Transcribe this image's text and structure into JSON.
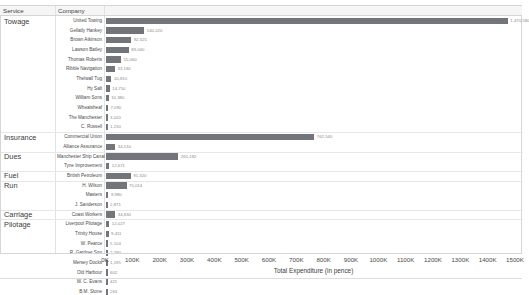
{
  "header": {
    "service_label": "Service",
    "company_label": "Company"
  },
  "axis": {
    "title": "Total Expenditure (in pence)",
    "ticks": [
      "0K",
      "100K",
      "200K",
      "300K",
      "400K",
      "500K",
      "600K",
      "700K",
      "800K",
      "900K",
      "1000K",
      "1100K",
      "1200K",
      "1300K",
      "1400K",
      "1500K"
    ],
    "min": 0,
    "max": 1500000
  },
  "colors": {
    "bar": "#72757a",
    "header_bg": "#f5f5f5",
    "grid": "#e7e7e7",
    "value_text": "#8a8a8a"
  },
  "chart_data": {
    "type": "bar",
    "orientation": "horizontal",
    "title": "",
    "xlabel": "Total Expenditure (in pence)",
    "ylabel": "",
    "xlim": [
      0,
      1500000
    ],
    "grid": false,
    "legend": "none",
    "groups": [
      {
        "service": "Towage",
        "rows": [
          {
            "company": "United Towing",
            "value": 1470000,
            "label": "1,470,580"
          },
          {
            "company": "Gellatly Hankey",
            "value": 140000,
            "label": "140,220"
          },
          {
            "company": "Brown Atkinson",
            "value": 92000,
            "label": "92,325"
          },
          {
            "company": "Lawson Batley",
            "value": 83000,
            "label": "83,040"
          },
          {
            "company": "Thomas Roberts",
            "value": 55000,
            "label": "55,060"
          },
          {
            "company": "Ribble Navigation",
            "value": 33000,
            "label": "33,180"
          },
          {
            "company": "Thelwall Tug",
            "value": 20000,
            "label": "20,810"
          },
          {
            "company": "Hy Salt",
            "value": 14000,
            "label": "14,750"
          },
          {
            "company": "William Sons",
            "value": 10000,
            "label": "10,380"
          },
          {
            "company": "Wheatsheaf",
            "value": 7000,
            "label": "7,090"
          },
          {
            "company": "The Manchester",
            "value": 3000,
            "label": "3,020"
          },
          {
            "company": "C. Russell",
            "value": 1200,
            "label": "1,230"
          }
        ]
      },
      {
        "service": "Insurance",
        "rows": [
          {
            "company": "Commercial Union",
            "value": 762000,
            "label": "762,540"
          },
          {
            "company": "Alliance Assurance",
            "value": 34000,
            "label": "34,510"
          }
        ]
      },
      {
        "service": "Dues",
        "rows": [
          {
            "company": "Manchester Ship Canal",
            "value": 265000,
            "label": "265,182"
          },
          {
            "company": "Tyne Improvement",
            "value": 12000,
            "label": "12,671"
          }
        ]
      },
      {
        "service": "Fuel",
        "rows": [
          {
            "company": "British Petroleum",
            "value": 91000,
            "label": "91,320"
          }
        ]
      },
      {
        "service": "Run",
        "rows": [
          {
            "company": "H. Wilson",
            "value": 75000,
            "label": "75,014"
          },
          {
            "company": "Masters",
            "value": 9000,
            "label": "9,980"
          },
          {
            "company": "J. Sanderson",
            "value": 2800,
            "label": "2,871"
          }
        ]
      },
      {
        "service": "Carriage",
        "rows": [
          {
            "company": "Coast Workers",
            "value": 34000,
            "label": "34,830"
          }
        ]
      },
      {
        "service": "Pilotage",
        "rows": [
          {
            "company": "Liverpool Pilotage",
            "value": 12000,
            "label": "12,027"
          },
          {
            "company": "Trinity House",
            "value": 9400,
            "label": "9,411"
          },
          {
            "company": "W. Pearce",
            "value": 5100,
            "label": "5,104"
          },
          {
            "company": "R. Gardner Son",
            "value": 2200,
            "label": "2,290"
          },
          {
            "company": "Mersey Docks",
            "value": 1100,
            "label": "1,195"
          },
          {
            "company": "Old Harbour",
            "value": 600,
            "label": "602"
          },
          {
            "company": "W. C. Evans",
            "value": 420,
            "label": "421"
          },
          {
            "company": "B.M. Stone",
            "value": 260,
            "label": "263"
          }
        ]
      }
    ]
  }
}
